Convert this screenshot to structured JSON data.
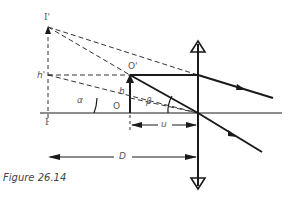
{
  "figure": {
    "caption": "Figure 26.14",
    "labels": {
      "image_top": "I'",
      "image_base": "I",
      "image_height": "h'",
      "object_top": "O'",
      "object_base": "O",
      "object_height": "h",
      "angle_alpha": "α",
      "angle_beta": "β",
      "object_distance": "u",
      "viewing_distance": "D"
    },
    "colors": {
      "line": "#1a1a1a",
      "dashed": "#333333",
      "label": "#555555"
    }
  }
}
